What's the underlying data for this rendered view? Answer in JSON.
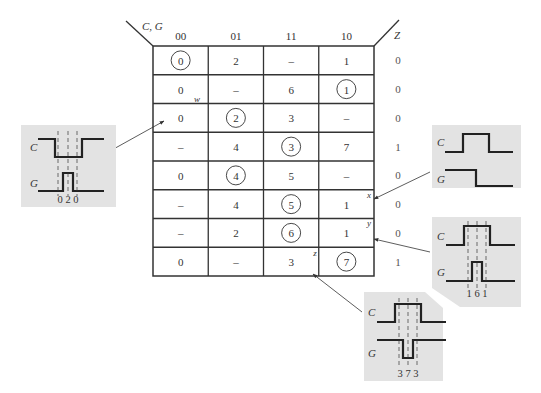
{
  "map": {
    "row_var_label": "C, G",
    "output_label": "Z",
    "columns": [
      "00",
      "01",
      "11",
      "10"
    ],
    "rows": [
      {
        "cells": [
          {
            "v": "0",
            "circled": true
          },
          {
            "v": "2",
            "circled": false
          },
          {
            "v": "–",
            "circled": false
          },
          {
            "v": "1",
            "circled": false
          }
        ],
        "z": "0"
      },
      {
        "cells": [
          {
            "v": "0",
            "circled": false
          },
          {
            "v": "–",
            "circled": false
          },
          {
            "v": "6",
            "circled": false
          },
          {
            "v": "1",
            "circled": true
          }
        ],
        "z": "0"
      },
      {
        "cells": [
          {
            "v": "0",
            "circled": false
          },
          {
            "v": "2",
            "circled": true
          },
          {
            "v": "3",
            "circled": false
          },
          {
            "v": "–",
            "circled": false
          }
        ],
        "z": "0"
      },
      {
        "cells": [
          {
            "v": "–",
            "circled": false
          },
          {
            "v": "4",
            "circled": false
          },
          {
            "v": "3",
            "circled": true
          },
          {
            "v": "7",
            "circled": false
          }
        ],
        "z": "1"
      },
      {
        "cells": [
          {
            "v": "0",
            "circled": false
          },
          {
            "v": "4",
            "circled": true
          },
          {
            "v": "5",
            "circled": false
          },
          {
            "v": "–",
            "circled": false
          }
        ],
        "z": "0"
      },
      {
        "cells": [
          {
            "v": "–",
            "circled": false
          },
          {
            "v": "4",
            "circled": false
          },
          {
            "v": "5",
            "circled": true
          },
          {
            "v": "1",
            "circled": false
          }
        ],
        "z": "0"
      },
      {
        "cells": [
          {
            "v": "–",
            "circled": false
          },
          {
            "v": "2",
            "circled": false
          },
          {
            "v": "6",
            "circled": true
          },
          {
            "v": "1",
            "circled": false
          }
        ],
        "z": "0"
      },
      {
        "cells": [
          {
            "v": "0",
            "circled": false
          },
          {
            "v": "–",
            "circled": false
          },
          {
            "v": "3",
            "circled": false
          },
          {
            "v": "7",
            "circled": true
          }
        ],
        "z": "1"
      }
    ],
    "markers": {
      "w": "w",
      "x": "x",
      "y": "y",
      "z": "z"
    }
  },
  "panels": {
    "w": {
      "c_label": "C",
      "g_label": "G",
      "states": "0 2 0"
    },
    "x": {
      "c_label": "C",
      "g_label": "G",
      "states": ""
    },
    "y": {
      "c_label": "C",
      "g_label": "G",
      "states": "1 6 1"
    },
    "z": {
      "c_label": "C",
      "g_label": "G",
      "states": "3 7 3"
    }
  },
  "colors": {
    "panel_bg": "#e3e3e3",
    "line": "#222222",
    "grid": "#333333"
  }
}
